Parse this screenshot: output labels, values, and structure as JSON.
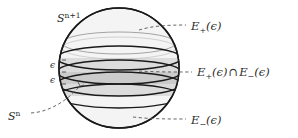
{
  "figure": {
    "type": "sphere-band-diagram",
    "labels": {
      "sphere": "S",
      "sphere_exp": "n+1",
      "equator": "S",
      "equator_exp": "n",
      "epsilon_upper": "ϵ",
      "epsilon_lower": "ϵ",
      "e_plus_base": "E",
      "e_plus_sub": "+",
      "e_plus_arg": "(ϵ)",
      "e_minus_base": "E",
      "e_minus_sub": "−",
      "e_minus_arg": "(ϵ)",
      "intersection_symbol": "∩"
    },
    "colors": {
      "outline": "#1a1a1a",
      "sphere_fill": "#f2f2f2",
      "band_outer": "#d8d8d8",
      "band_inner": "#c9c9c9",
      "leader": "#4a4a4a",
      "text": "#2b2b2b"
    },
    "geometry": {
      "center_x": 119,
      "center_y": 68,
      "radius": 60,
      "upper_cap_y": 43,
      "band_top_y": 58,
      "band_mid_upper_y": 72,
      "band_mid_lower_y": 84,
      "band_bottom_y": 96
    }
  }
}
